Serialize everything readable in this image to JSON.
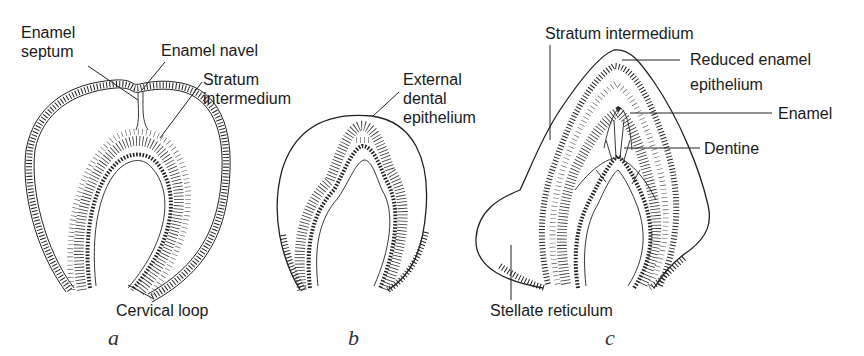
{
  "figure": {
    "panels": [
      {
        "id": "a",
        "letter": "a",
        "labels": {
          "enamel_septum_line1": "Enamel",
          "enamel_septum_line2": "septum",
          "enamel_navel": "Enamel navel",
          "stratum_line1": "Stratum",
          "stratum_line2": "intermedium",
          "cervical_loop": "Cervical loop"
        }
      },
      {
        "id": "b",
        "letter": "b",
        "labels": {
          "ede_line1": "External",
          "ede_line2": "dental",
          "ede_line3": "epithelium"
        }
      },
      {
        "id": "c",
        "letter": "c",
        "labels": {
          "stratum_intermedium": "Stratum intermedium",
          "ree_line1": "Reduced enamel",
          "ree_line2": "epithelium",
          "enamel": "Enamel",
          "dentine": "Dentine",
          "stellate_reticulum": "Stellate reticulum"
        }
      }
    ]
  },
  "colors": {
    "ink": "#222222",
    "background": "#ffffff"
  }
}
